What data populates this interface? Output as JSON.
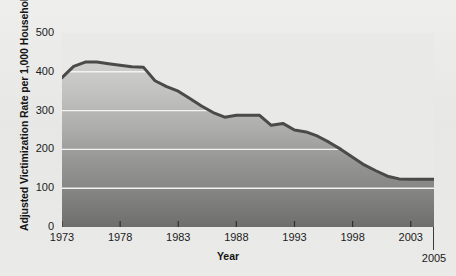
{
  "figure": {
    "background_color": "#e9e9e7",
    "plot_area": {
      "fill_top_color": "#d8d8d6",
      "fill_bottom_color": "#6f6f6f",
      "gridline_color": "#f2f2f0",
      "line_color": "#4a4a4a"
    }
  },
  "chart_data": {
    "type": "area",
    "title": "",
    "subtitle": "",
    "xlabel": "Year",
    "ylabel": "Adjusted Victimization Rate per 1,000 Households",
    "xlim": [
      1973,
      2005
    ],
    "ylim": [
      0,
      500
    ],
    "grid": true,
    "legend": null,
    "legend_position": "none",
    "y_ticks": [
      0,
      100,
      200,
      300,
      400,
      500
    ],
    "y_tick_labels": [
      "0",
      "100",
      "200",
      "300",
      "400",
      "500"
    ],
    "x_ticks": [
      1973,
      1978,
      1983,
      1988,
      1993,
      1998,
      2003
    ],
    "x_tick_labels": [
      "1973",
      "1978",
      "1983",
      "1988",
      "1993",
      "1998",
      "2003"
    ],
    "x_end_label": "2005",
    "x": [
      1973,
      1974,
      1975,
      1976,
      1977,
      1978,
      1979,
      1980,
      1981,
      1982,
      1983,
      1984,
      1985,
      1986,
      1987,
      1988,
      1989,
      1990,
      1991,
      1992,
      1993,
      1994,
      1995,
      1996,
      1997,
      1998,
      1999,
      2000,
      2001,
      2002,
      2003,
      2004,
      2005
    ],
    "values": [
      385,
      414,
      425,
      425,
      421,
      417,
      413,
      412,
      377,
      362,
      350,
      331,
      312,
      295,
      283,
      288,
      288,
      288,
      262,
      267,
      250,
      245,
      234,
      218,
      200,
      180,
      160,
      145,
      131,
      124,
      123,
      123,
      123
    ],
    "series": [
      {
        "name": "Adjusted Victimization Rate",
        "values": [
          385,
          414,
          425,
          425,
          421,
          417,
          413,
          412,
          377,
          362,
          350,
          331,
          312,
          295,
          283,
          288,
          288,
          288,
          262,
          267,
          250,
          245,
          234,
          218,
          200,
          180,
          160,
          145,
          131,
          124,
          123,
          123,
          123
        ]
      }
    ]
  }
}
